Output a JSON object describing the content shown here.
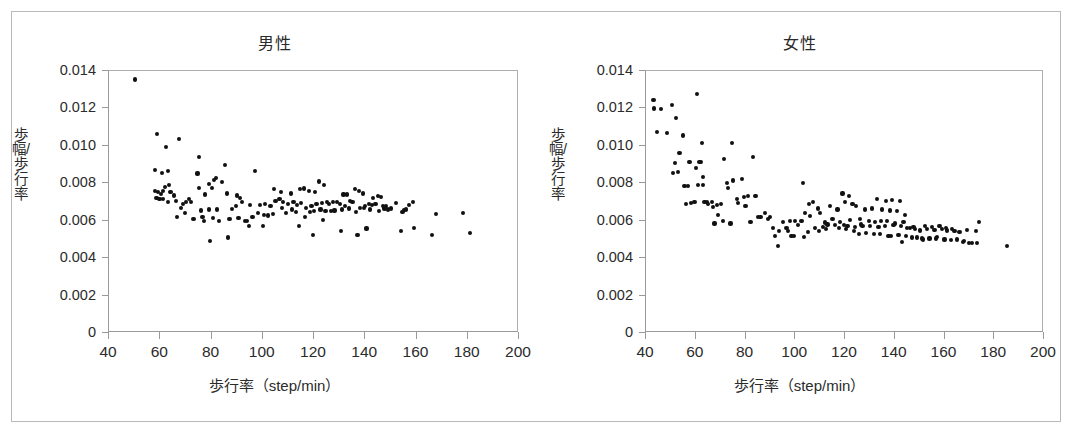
{
  "figure": {
    "panels": [
      {
        "id": "male",
        "title": "男性",
        "xaxis_title": "歩行率（step/min）",
        "yaxis_title": "歩幅/歩行率"
      },
      {
        "id": "female",
        "title": "女性",
        "xaxis_title": "歩行率（step/min）",
        "yaxis_title": "歩幅/歩行率"
      }
    ],
    "axis": {
      "x_ticks": [
        "40",
        "60",
        "80",
        "100",
        "120",
        "140",
        "160",
        "180",
        "200"
      ],
      "y_ticks": [
        "0",
        "0.002",
        "0.004",
        "0.006",
        "0.008",
        "0.010",
        "0.012",
        "0.014"
      ]
    },
    "colors": {
      "marker": "#111111",
      "axis": "#9a9a9a",
      "border": "#b9b9b9",
      "text": "#2b2b2b",
      "background": "#ffffff"
    }
  },
  "chart_data": [
    {
      "type": "scatter",
      "title": "男性",
      "xlabel": "歩行率（step/min）",
      "ylabel": "歩幅/歩行率",
      "xlim": [
        40,
        200
      ],
      "ylim": [
        0,
        0.014
      ],
      "xticks": [
        40,
        60,
        80,
        100,
        120,
        140,
        160,
        180,
        200
      ],
      "yticks": [
        0,
        0.002,
        0.004,
        0.006,
        0.008,
        0.01,
        0.012,
        0.014
      ],
      "grid": false,
      "legend": "none",
      "marker_color": "#111111",
      "n_points": 150,
      "x": [
        50.0,
        58.6,
        62.4,
        67.3,
        58.0,
        60.6,
        62.9,
        63.4,
        75.0,
        81.9,
        85.2,
        97.0,
        74.5,
        78.9,
        81.0,
        84.0,
        58.0,
        59.0,
        60.2,
        61.1,
        62.0,
        66.1,
        69.0,
        71.3,
        75.2,
        77.6,
        80.1,
        86.2,
        90.0,
        91.2,
        104.5,
        107.0,
        111.0,
        114.5,
        116.0,
        118.0,
        120.5,
        122.0,
        124.0,
        131.5,
        133.0,
        136.0,
        137.5,
        139.0,
        143.0,
        145.0,
        146.0,
        58.5,
        59.6,
        61.0,
        64.0,
        65.5,
        68.0,
        70.0,
        72.0,
        76.0,
        79.0,
        82.0,
        88.0,
        89.5,
        92.0,
        95.0,
        99.0,
        101.0,
        103.0,
        105.0,
        106.5,
        108.0,
        110.0,
        112.0,
        113.5,
        115.0,
        117.0,
        119.0,
        121.0,
        123.0,
        125.0,
        126.0,
        127.5,
        129.0,
        130.0,
        132.0,
        134.0,
        135.0,
        138.0,
        140.0,
        141.5,
        142.5,
        144.0,
        147.0,
        148.0,
        150.0,
        152.0,
        154.5,
        157.0,
        158.5,
        60.0,
        63.0,
        66.5,
        69.5,
        73.0,
        77.0,
        80.5,
        83.0,
        87.0,
        90.5,
        93.0,
        96.0,
        98.0,
        100.5,
        102.0,
        104.0,
        107.5,
        109.0,
        111.5,
        113.0,
        116.5,
        118.5,
        120.0,
        122.5,
        124.5,
        126.5,
        128.0,
        131.0,
        133.5,
        136.5,
        139.5,
        142.0,
        145.5,
        147.5,
        149.0,
        155.0,
        156.0,
        167.5,
        178.0,
        181.0,
        76.5,
        79.5,
        86.5,
        94.0,
        100.0,
        114.0,
        119.5,
        123.5,
        130.5,
        137.0,
        140.5,
        154.0,
        159.0,
        166.0,
        94.5
      ],
      "y": [
        0.01355,
        0.01065,
        0.00995,
        0.01035,
        0.00872,
        0.00857,
        0.00866,
        0.0079,
        0.0094,
        0.0083,
        0.00898,
        0.00866,
        0.00852,
        0.00795,
        0.00817,
        0.00805,
        0.0076,
        0.00755,
        0.00742,
        0.0076,
        0.0078,
        0.00705,
        0.0069,
        0.00715,
        0.00775,
        0.0074,
        0.00775,
        0.00745,
        0.00735,
        0.0072,
        0.0077,
        0.00755,
        0.00745,
        0.0077,
        0.00772,
        0.0076,
        0.00755,
        0.0081,
        0.0079,
        0.0074,
        0.0074,
        0.0077,
        0.0076,
        0.00745,
        0.0072,
        0.0073,
        0.00725,
        0.0072,
        0.00715,
        0.00718,
        0.00755,
        0.00735,
        0.0067,
        0.007,
        0.007,
        0.00655,
        0.0066,
        0.0066,
        0.00663,
        0.0068,
        0.007,
        0.00685,
        0.00682,
        0.0069,
        0.0068,
        0.00705,
        0.00715,
        0.007,
        0.0069,
        0.007,
        0.00685,
        0.00695,
        0.0067,
        0.0068,
        0.0069,
        0.00695,
        0.007,
        0.0069,
        0.007,
        0.007,
        0.0069,
        0.0068,
        0.00705,
        0.007,
        0.0067,
        0.0068,
        0.0069,
        0.00685,
        0.0069,
        0.0068,
        0.0068,
        0.00665,
        0.00695,
        0.00648,
        0.00685,
        0.007,
        0.00715,
        0.007,
        0.0062,
        0.0064,
        0.0061,
        0.00598,
        0.00615,
        0.006,
        0.0061,
        0.00615,
        0.006,
        0.00618,
        0.0064,
        0.0063,
        0.00628,
        0.00638,
        0.0067,
        0.0064,
        0.0066,
        0.00645,
        0.0062,
        0.00645,
        0.0065,
        0.0066,
        0.0065,
        0.00652,
        0.00655,
        0.0066,
        0.00665,
        0.00648,
        0.0067,
        0.0066,
        0.0065,
        0.00665,
        0.0066,
        0.00658,
        0.0066,
        0.00635,
        0.0064,
        0.00535,
        0.00622,
        0.0049,
        0.0051,
        0.006,
        0.0057,
        0.00572,
        0.00525,
        0.00605,
        0.00545,
        0.00525,
        0.00558,
        0.00545,
        0.0056,
        0.00525,
        0.00572,
        0.00535,
        0.00588
      ]
    },
    {
      "type": "scatter",
      "title": "女性",
      "xlabel": "歩行率（step/min）",
      "ylabel": "歩幅/歩行率",
      "xlim": [
        40,
        200
      ],
      "ylim": [
        0,
        0.014
      ],
      "xticks": [
        40,
        60,
        80,
        100,
        120,
        140,
        160,
        180,
        200
      ],
      "yticks": [
        0,
        0.002,
        0.004,
        0.006,
        0.008,
        0.01,
        0.012,
        0.014
      ],
      "grid": false,
      "legend": "none",
      "marker_color": "#111111",
      "n_points": 168,
      "x": [
        43.0,
        43.2,
        46.0,
        50.5,
        60.5,
        44.5,
        48.5,
        52.0,
        55.0,
        51.5,
        62.5,
        53.5,
        57.5,
        62.0,
        74.5,
        51.0,
        53.0,
        60.0,
        61.5,
        71.5,
        83.0,
        63.0,
        55.5,
        57.0,
        61.0,
        62.8,
        72.5,
        75.0,
        78.5,
        56.0,
        58.0,
        59.5,
        63.5,
        64.5,
        66.5,
        76.5,
        79.5,
        81.0,
        103.0,
        65.0,
        67.0,
        68.5,
        70.0,
        73.0,
        77.0,
        80.0,
        84.0,
        88.0,
        90.0,
        119.0,
        121.5,
        133.0,
        136.5,
        139.0,
        142.0,
        105.5,
        107.0,
        109.0,
        114.0,
        117.0,
        120.0,
        123.0,
        124.5,
        128.0,
        131.0,
        135.0,
        138.0,
        141.0,
        144.0,
        67.5,
        69.0,
        71.0,
        74.0,
        82.0,
        85.0,
        89.0,
        95.0,
        100.0,
        104.0,
        106.0,
        110.0,
        112.0,
        115.0,
        118.0,
        122.0,
        126.0,
        129.5,
        132.0,
        134.5,
        137.0,
        140.0,
        143.5,
        146.0,
        148.0,
        152.0,
        155.0,
        158.0,
        160.5,
        163.0,
        172.5,
        86.0,
        91.0,
        93.5,
        96.5,
        98.0,
        101.0,
        102.5,
        108.0,
        111.0,
        113.0,
        116.0,
        119.5,
        121.0,
        124.0,
        127.0,
        130.0,
        133.5,
        136.0,
        139.5,
        142.5,
        145.0,
        147.5,
        150.0,
        153.0,
        156.0,
        159.0,
        161.0,
        164.0,
        166.0,
        169.0,
        174.0,
        92.0,
        97.0,
        99.5,
        103.5,
        105.0,
        109.5,
        112.5,
        117.5,
        120.5,
        123.5,
        125.5,
        128.5,
        131.5,
        134.0,
        137.5,
        141.5,
        144.5,
        149.0,
        151.0,
        154.0,
        157.0,
        160.0,
        162.5,
        165.0,
        167.5,
        170.0,
        171.0,
        185.0,
        93.0,
        98.5,
        126.5,
        138.5,
        143.0,
        147.0,
        151.5,
        156.5,
        168.0,
        173.0
      ],
      "y": [
        0.01245,
        0.012,
        0.01195,
        0.0122,
        0.01275,
        0.01075,
        0.0107,
        0.0115,
        0.01055,
        0.0091,
        0.01015,
        0.0096,
        0.00915,
        0.00915,
        0.01015,
        0.00855,
        0.0086,
        0.0088,
        0.00915,
        0.0093,
        0.0094,
        0.00835,
        0.00785,
        0.00785,
        0.0079,
        0.0079,
        0.008,
        0.00815,
        0.00825,
        0.0069,
        0.00695,
        0.007,
        0.007,
        0.007,
        0.007,
        0.00718,
        0.00725,
        0.0073,
        0.008,
        0.0069,
        0.00675,
        0.00685,
        0.0069,
        0.00775,
        0.00695,
        0.0068,
        0.0073,
        0.0064,
        0.0062,
        0.00745,
        0.0073,
        0.00715,
        0.00705,
        0.0071,
        0.00705,
        0.0069,
        0.007,
        0.00665,
        0.0068,
        0.0066,
        0.007,
        0.0069,
        0.0068,
        0.0066,
        0.00665,
        0.0066,
        0.00655,
        0.0065,
        0.0063,
        0.00585,
        0.0063,
        0.006,
        0.00585,
        0.00595,
        0.0062,
        0.0061,
        0.00595,
        0.006,
        0.0064,
        0.00625,
        0.0064,
        0.0059,
        0.0061,
        0.00595,
        0.00605,
        0.0061,
        0.006,
        0.00595,
        0.006,
        0.006,
        0.00585,
        0.00595,
        0.0056,
        0.00555,
        0.0057,
        0.00565,
        0.0057,
        0.0056,
        0.00555,
        0.00545,
        0.0062,
        0.0056,
        0.00545,
        0.0056,
        0.00598,
        0.00575,
        0.006,
        0.0056,
        0.00565,
        0.0058,
        0.00575,
        0.00575,
        0.0057,
        0.00565,
        0.0057,
        0.0057,
        0.00565,
        0.0057,
        0.00575,
        0.0057,
        0.0056,
        0.00565,
        0.00548,
        0.00555,
        0.0055,
        0.00555,
        0.00548,
        0.00545,
        0.0054,
        0.0055,
        0.00595,
        0.0052,
        0.00545,
        0.0052,
        0.00512,
        0.0054,
        0.00545,
        0.00555,
        0.0056,
        0.00555,
        0.00545,
        0.0053,
        0.00535,
        0.00528,
        0.0053,
        0.0052,
        0.00522,
        0.0052,
        0.0051,
        0.00505,
        0.00505,
        0.00515,
        0.005,
        0.00495,
        0.005,
        0.00485,
        0.0048,
        0.0048,
        0.00465,
        0.00465,
        0.0052,
        0.0058,
        0.0052,
        0.00485,
        0.0051,
        0.005,
        0.00505,
        0.0049,
        0.0048,
        0.0048
      ]
    }
  ]
}
